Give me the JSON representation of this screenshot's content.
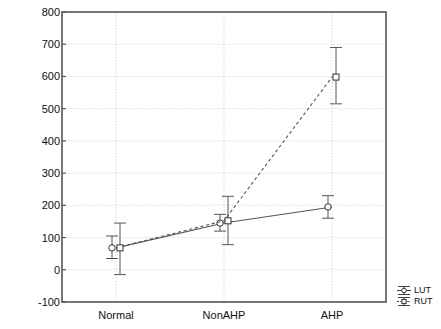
{
  "chart_data": {
    "type": "line",
    "title": "",
    "xlabel": "",
    "ylabel": "Muscle activity (micronV)",
    "categories": [
      "Normal",
      "NonAHP",
      "AHP"
    ],
    "ylim": [
      -100,
      800
    ],
    "yticks": [
      -100,
      0,
      100,
      200,
      300,
      400,
      500,
      600,
      700,
      800
    ],
    "ytick_labels": [
      "-100",
      "0",
      "100",
      "200",
      "300",
      "400",
      "500",
      "600",
      "700",
      "800"
    ],
    "grid": true,
    "grid_style": "dotted",
    "legend_position": "outside-bottom-right",
    "series": [
      {
        "name": "LUT",
        "marker": "circle",
        "line_style": "solid",
        "color": "#555555",
        "values": [
          68,
          145,
          195
        ],
        "err_low": [
          35,
          120,
          160
        ],
        "err_high": [
          105,
          172,
          230
        ]
      },
      {
        "name": "RUT",
        "marker": "square",
        "line_style": "dashed",
        "color": "#555555",
        "values": [
          68,
          152,
          598
        ],
        "err_low": [
          -15,
          78,
          515
        ],
        "err_high": [
          145,
          228,
          690
        ]
      }
    ]
  },
  "legend": {
    "items": [
      {
        "label": "LUT",
        "marker": "circle"
      },
      {
        "label": "RUT",
        "marker": "square"
      }
    ]
  },
  "axes": {
    "y_axis_label": "Muscle activity (micronV)"
  }
}
